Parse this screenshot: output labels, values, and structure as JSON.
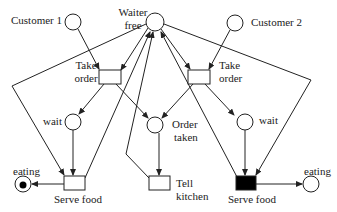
{
  "diagram": {
    "type": "petri-net",
    "places": [
      {
        "id": "customer1",
        "label": "Customer 1"
      },
      {
        "id": "waiter_free",
        "label_line1": "Waiter",
        "label_line2": "free"
      },
      {
        "id": "customer2",
        "label": "Customer 2"
      },
      {
        "id": "wait1",
        "label": "wait"
      },
      {
        "id": "order_taken",
        "label_line1": "Order",
        "label_line2": "taken"
      },
      {
        "id": "wait2",
        "label": "wait"
      },
      {
        "id": "eating1",
        "label": "eating",
        "token": true
      },
      {
        "id": "eating2",
        "label": "eating",
        "token": false
      }
    ],
    "transitions": [
      {
        "id": "take_order1",
        "label_line1": "Take",
        "label_line2": "order"
      },
      {
        "id": "take_order2",
        "label_line1": "Take",
        "label_line2": "order"
      },
      {
        "id": "serve_food1",
        "label": "Serve food",
        "enabled": false
      },
      {
        "id": "tell_kitchen",
        "label_line1": "Tell",
        "label_line2": "kitchen"
      },
      {
        "id": "serve_food2",
        "label": "Serve food",
        "enabled": true
      }
    ],
    "colors": {
      "stroke": "#222222",
      "fired": "#000000",
      "background": "#ffffff"
    }
  }
}
